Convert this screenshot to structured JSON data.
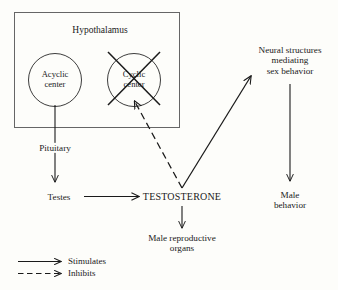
{
  "diagram": {
    "container": {
      "label": "Hypothalamus"
    },
    "nodes": {
      "acyclic_center": "Acyclic\ncenter",
      "cyclic_center": "Cyclic\ncenter",
      "pituitary": "Pituitary",
      "testes": "Testes",
      "testosterone": "TESTOSTERONE",
      "male_reproductive_organs": "Male reproductive\norgans",
      "neural_structures": "Neural structures\nmediating\nsex behavior",
      "male_behavior": "Male\nbehavior"
    },
    "legend": {
      "items": [
        {
          "label": "Stimulates",
          "style": "solid"
        },
        {
          "label": "Inhibits",
          "style": "dashed"
        }
      ]
    },
    "colors": {
      "stroke": "#1a1a1a",
      "background": "#fdfdfa",
      "box_stroke": "#555555"
    },
    "edges": [
      {
        "from": "acyclic_center",
        "to": "testes",
        "style": "solid",
        "via": "pituitary"
      },
      {
        "from": "testes",
        "to": "testosterone",
        "style": "solid"
      },
      {
        "from": "testosterone",
        "to": "cyclic_center",
        "style": "dashed"
      },
      {
        "from": "testosterone",
        "to": "neural_structures",
        "style": "solid"
      },
      {
        "from": "testosterone",
        "to": "male_reproductive_organs",
        "style": "solid"
      },
      {
        "from": "neural_structures",
        "to": "male_behavior",
        "style": "solid"
      }
    ],
    "annotations": {
      "cyclic_center_crossed_out": true
    }
  }
}
